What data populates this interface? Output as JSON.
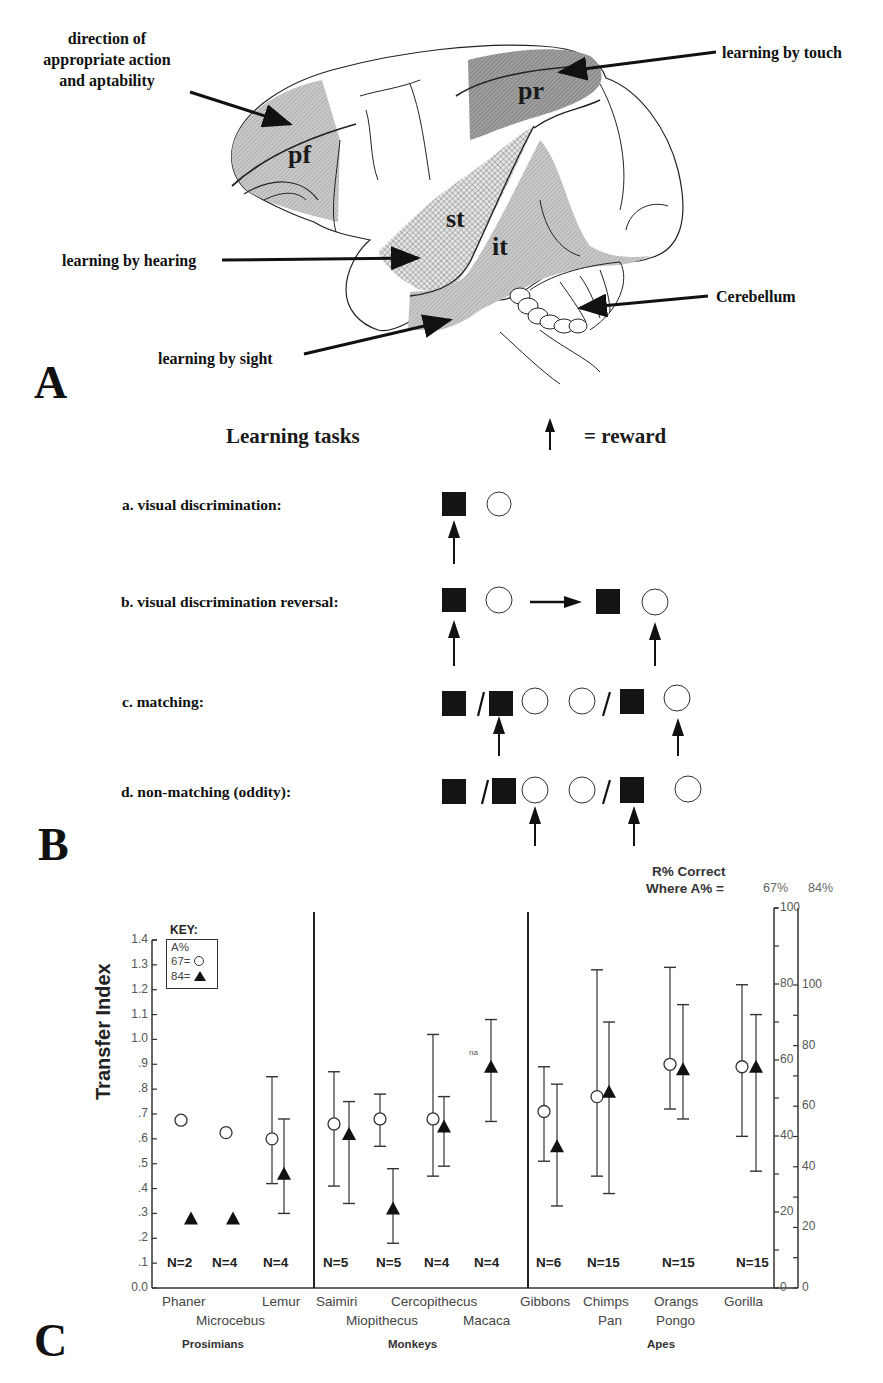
{
  "panel_a": {
    "letter": "A",
    "annotations": {
      "pf_label_lines": [
        "direction of",
        "appropriate action",
        "and aptability"
      ],
      "touch": "learning by touch",
      "hearing": "learning by hearing",
      "sight": "learning by sight",
      "cerebellum": "Cerebellum"
    },
    "regions": {
      "pf": "pf",
      "pr": "pr",
      "st": "st",
      "it": "it"
    }
  },
  "panel_b": {
    "letter": "B",
    "title": "Learning tasks",
    "legend": "= reward",
    "tasks": [
      {
        "label": "a. visual discrimination:"
      },
      {
        "label": "b. visual discrimination reversal:"
      },
      {
        "label": "c. matching:"
      },
      {
        "label": "d. non-matching (oddity):"
      }
    ]
  },
  "panel_c": {
    "letter": "C",
    "right_axis_title_1": "R% Correct",
    "right_axis_title_2": "Where A% =",
    "right_axis_67": "67%",
    "right_axis_84": "84%",
    "key": {
      "title": "KEY:",
      "header": "A%",
      "row1": "67=",
      "row2": "84="
    },
    "na": "na",
    "groups": [
      "Prosimians",
      "Monkeys",
      "Apes"
    ]
  },
  "chart_data": {
    "type": "scatter",
    "title": "",
    "ylabel": "Transfer Index",
    "xlabel": "",
    "ylim": [
      0.0,
      1.4
    ],
    "yticks": [
      "0.0",
      ".1",
      ".2",
      ".3",
      ".4",
      ".5",
      ".6",
      ".7",
      ".8",
      ".9",
      "1.0",
      "1.1",
      "1.2",
      "1.3",
      "1.4"
    ],
    "secondary_axes": [
      {
        "name": "R% Correct where A% = 67%",
        "ticks": [
          0,
          20,
          40,
          60,
          80,
          100
        ]
      },
      {
        "name": "R% Correct where A% = 84%",
        "ticks": [
          0,
          20,
          40,
          60,
          80,
          100
        ]
      }
    ],
    "legend": [
      {
        "label": "A% 67",
        "marker": "open-circle"
      },
      {
        "label": "A% 84",
        "marker": "filled-triangle"
      }
    ],
    "categories": [
      "Phaner",
      "Microcebus",
      "Lemur",
      "Saimiri",
      "Miopithecus",
      "Cercopithecus",
      "Macaca",
      "Gibbons",
      "Chimps Pan",
      "Orangs Pongo",
      "Gorilla"
    ],
    "category_lines": [
      [
        "Phaner",
        ""
      ],
      [
        "",
        "Microcebus"
      ],
      [
        "Lemur",
        ""
      ],
      [
        "Saimiri",
        ""
      ],
      [
        "",
        "Miopithecus"
      ],
      [
        "Cercopithecus",
        ""
      ],
      [
        "",
        "Macaca"
      ],
      [
        "Gibbons",
        ""
      ],
      [
        "Chimps",
        "Pan"
      ],
      [
        "Orangs",
        "Pongo"
      ],
      [
        "Gorilla",
        ""
      ]
    ],
    "group_of_category": [
      "Prosimians",
      "Prosimians",
      "Prosimians",
      "Monkeys",
      "Monkeys",
      "Monkeys",
      "Monkeys",
      "Apes",
      "Apes",
      "Apes",
      "Apes"
    ],
    "n_labels": [
      {
        "text": "N=2",
        "x": 183
      },
      {
        "text": "N=4",
        "x": 228
      },
      {
        "text": "N=4",
        "x": 279
      },
      {
        "text": "N=5",
        "x": 339
      },
      {
        "text": "N=5",
        "x": 392
      },
      {
        "text": "N=4",
        "x": 440
      },
      {
        "text": "N=4",
        "x": 490
      },
      {
        "text": "N=6",
        "x": 552
      },
      {
        "text": "N=15",
        "x": 603
      },
      {
        "text": "N=15",
        "x": 678
      },
      {
        "text": "N=15",
        "x": 752
      }
    ],
    "series": [
      {
        "name": "A% 67",
        "marker": "open-circle",
        "points": [
          {
            "cat": "Phaner",
            "x": 181,
            "y": 0.675,
            "lo": null,
            "hi": null
          },
          {
            "cat": "Microcebus",
            "x": 226,
            "y": 0.625,
            "lo": null,
            "hi": null
          },
          {
            "cat": "Lemur",
            "x": 272,
            "y": 0.6,
            "lo": 0.42,
            "hi": 0.85
          },
          {
            "cat": "Saimiri",
            "x": 334,
            "y": 0.66,
            "lo": 0.41,
            "hi": 0.87
          },
          {
            "cat": "Miopithecus",
            "x": 380,
            "y": 0.68,
            "lo": 0.57,
            "hi": 0.78
          },
          {
            "cat": "Cercopithecus",
            "x": 433,
            "y": 0.68,
            "lo": 0.45,
            "hi": 1.02
          },
          {
            "cat": "Gibbons",
            "x": 544,
            "y": 0.71,
            "lo": 0.51,
            "hi": 0.89
          },
          {
            "cat": "Chimps Pan",
            "x": 597,
            "y": 0.77,
            "lo": 0.45,
            "hi": 1.28
          },
          {
            "cat": "Orangs Pongo",
            "x": 670,
            "y": 0.9,
            "lo": 0.72,
            "hi": 1.29
          },
          {
            "cat": "Gorilla",
            "x": 742,
            "y": 0.89,
            "lo": 0.61,
            "hi": 1.22
          }
        ]
      },
      {
        "name": "A% 84",
        "marker": "filled-triangle",
        "points": [
          {
            "cat": "Phaner",
            "x": 191,
            "y": 0.28,
            "lo": null,
            "hi": null
          },
          {
            "cat": "Microcebus",
            "x": 233,
            "y": 0.28,
            "lo": null,
            "hi": null
          },
          {
            "cat": "Lemur",
            "x": 284,
            "y": 0.46,
            "lo": 0.3,
            "hi": 0.68
          },
          {
            "cat": "Saimiri",
            "x": 349,
            "y": 0.62,
            "lo": 0.34,
            "hi": 0.75
          },
          {
            "cat": "Miopithecus",
            "x": 393,
            "y": 0.32,
            "lo": 0.18,
            "hi": 0.48
          },
          {
            "cat": "Cercopithecus",
            "x": 444,
            "y": 0.65,
            "lo": 0.49,
            "hi": 0.77
          },
          {
            "cat": "Macaca",
            "x": 491,
            "y": 0.89,
            "lo": 0.67,
            "hi": 1.08
          },
          {
            "cat": "Gibbons",
            "x": 557,
            "y": 0.57,
            "lo": 0.33,
            "hi": 0.82
          },
          {
            "cat": "Chimps Pan",
            "x": 609,
            "y": 0.79,
            "lo": 0.38,
            "hi": 1.07
          },
          {
            "cat": "Orangs Pongo",
            "x": 683,
            "y": 0.88,
            "lo": 0.68,
            "hi": 1.14
          },
          {
            "cat": "Gorilla",
            "x": 756,
            "y": 0.89,
            "lo": 0.47,
            "hi": 1.1
          }
        ]
      }
    ]
  }
}
